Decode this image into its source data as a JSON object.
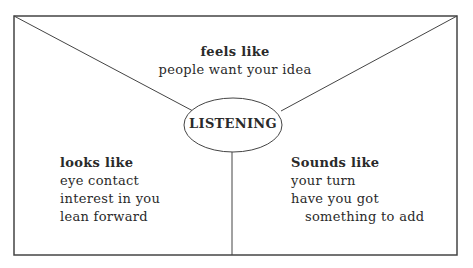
{
  "diagram": {
    "center_label": "LISTENING",
    "feels": {
      "heading": "feels like",
      "lines": [
        "people want your idea"
      ]
    },
    "looks": {
      "heading": "looks like",
      "lines": [
        "eye contact",
        "interest in you",
        "lean forward"
      ]
    },
    "sounds": {
      "heading": "Sounds like",
      "lines": [
        "your turn",
        "have you got",
        "something to add"
      ]
    }
  }
}
